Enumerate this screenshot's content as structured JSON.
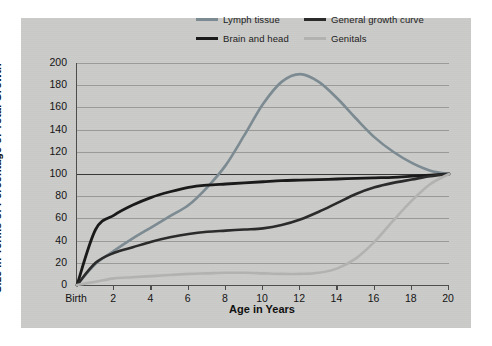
{
  "chart_data": {
    "type": "line",
    "title": "",
    "xlabel": "Age in Years",
    "ylabel": "Size in Terms of Percentage of Total Growth",
    "xlim": [
      0,
      20
    ],
    "ylim": [
      0,
      200
    ],
    "grid": true,
    "legend_position": "top-right",
    "x_tick_labels": [
      "Birth",
      "2",
      "4",
      "6",
      "8",
      "10",
      "12",
      "14",
      "16",
      "18",
      "20"
    ],
    "x_tick_values": [
      0,
      2,
      4,
      6,
      8,
      10,
      12,
      14,
      16,
      18,
      20
    ],
    "y_tick_labels": [
      "0",
      "20",
      "40",
      "60",
      "80",
      "100",
      "120",
      "140",
      "160",
      "180",
      "200"
    ],
    "y_tick_values": [
      0,
      20,
      40,
      60,
      80,
      100,
      120,
      140,
      160,
      180,
      200
    ],
    "x": [
      0,
      1,
      2,
      3,
      4,
      5,
      6,
      7,
      8,
      9,
      10,
      11,
      12,
      13,
      14,
      15,
      16,
      17,
      18,
      19,
      20
    ],
    "series": [
      {
        "name": "Lymph tissue",
        "color": "#7c8a92",
        "values": [
          0,
          19,
          31,
          42,
          52,
          62,
          72,
          88,
          108,
          135,
          163,
          183,
          190,
          183,
          168,
          150,
          133,
          120,
          110,
          103,
          100
        ]
      },
      {
        "name": "Brain and head",
        "color": "#1a1a1a",
        "values": [
          0,
          50,
          63,
          72,
          79,
          84,
          88,
          90,
          91,
          92,
          93,
          94,
          94.5,
          95,
          95.5,
          96,
          96.5,
          97,
          98,
          99,
          100
        ]
      },
      {
        "name": "General growth curve",
        "color": "#2b2b2b",
        "values": [
          0,
          20,
          29,
          34,
          39,
          43,
          46,
          48,
          49,
          50,
          51,
          54,
          59,
          66,
          74,
          82,
          88,
          92,
          95,
          98,
          100
        ]
      },
      {
        "name": "Genitals",
        "color": "#b2b2b0",
        "values": [
          0,
          3,
          6,
          7,
          8,
          9,
          10,
          10.5,
          11,
          11,
          10.5,
          10,
          10,
          11,
          15,
          24,
          39,
          58,
          76,
          91,
          100
        ]
      }
    ]
  },
  "legend": {
    "items": [
      {
        "label": "Lymph tissue",
        "color": "#7c8a92"
      },
      {
        "label": "General growth curve",
        "color": "#2b2b2b"
      },
      {
        "label": "Brain and head",
        "color": "#1a1a1a"
      },
      {
        "label": "Genitals",
        "color": "#b2b2b0"
      }
    ]
  },
  "axes": {
    "x_title": "Age in Years",
    "y_title": "Size in Terms of Percentage of Total Growth"
  },
  "colors": {
    "panel_background": "#cbcbc9",
    "page_background": "#ffffff",
    "gridline": "#9a9a98",
    "axis": "#4d4d4d",
    "reference_line_100": "#3a3a3a"
  }
}
